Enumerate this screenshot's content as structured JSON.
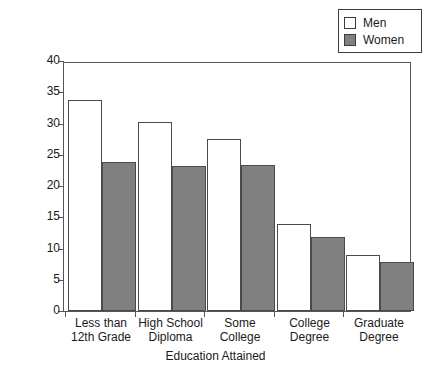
{
  "chart_data": {
    "type": "bar",
    "title": "",
    "xlabel": "Education Attained",
    "ylabel": "Percentage Who Smoke",
    "categories": [
      "Less than\n12th Grade",
      "High School\nDiploma",
      "Some\nCollege",
      "College\nDegree",
      "Graduate\nDegree"
    ],
    "series": [
      {
        "name": "Men",
        "values": [
          33.7,
          30.3,
          27.6,
          13.9,
          9.0
        ],
        "color": "#ffffff"
      },
      {
        "name": "Women",
        "values": [
          23.9,
          23.2,
          23.3,
          11.9,
          7.8
        ],
        "color": "#808080"
      }
    ],
    "ylim": [
      0,
      40
    ],
    "yticks": [
      0,
      5,
      10,
      15,
      20,
      25,
      30,
      35,
      40
    ],
    "ytick_labels": [
      "0",
      "5",
      "10",
      "15",
      "20",
      "25",
      "30",
      "35",
      "40"
    ],
    "grid": false,
    "legend_position": "top-right",
    "legend_entries": [
      "Men",
      "Women"
    ]
  },
  "legend": {
    "entries": [
      {
        "label": "Men",
        "swatch": "legend-swatch-men"
      },
      {
        "label": "Women",
        "swatch": "legend-swatch-women"
      }
    ]
  }
}
